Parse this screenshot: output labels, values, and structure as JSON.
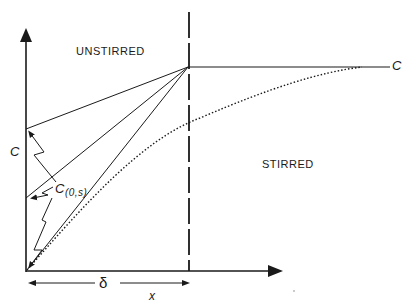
{
  "labels": {
    "unstirred": "UNSTIRRED",
    "stirred": "STIRRED",
    "c_axis": "C",
    "c_bulk": "C",
    "c_surface": "C",
    "c_surface_sub": "(0,s)",
    "delta": "δ",
    "x_axis": "x"
  },
  "colors": {
    "ink": "#1a1a1a",
    "background": "#ffffff"
  }
}
